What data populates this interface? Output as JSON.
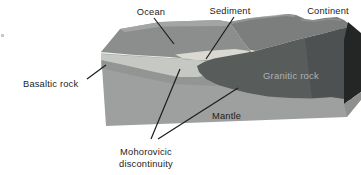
{
  "diagram": {
    "labels": {
      "ocean": "Ocean",
      "sediment": "Sediment",
      "continent": "Continent",
      "basaltic_rock": "Basaltic rock",
      "granitic_rock": "Granitic rock",
      "mantle": "Mantle",
      "moho_line1": "Mohorovicic",
      "moho_line2": "discontinuity"
    },
    "colors": {
      "background": "#ffffff",
      "ocean_surface": "#8b8e8d",
      "ocean_back_strip": "#a5a7a5",
      "continent_surface": "#7b7e7d",
      "continent_highlight": "#9a9d9b",
      "granitic_rock": "#585c5b",
      "granitic_rock_shadow": "#454848",
      "basaltic_layer": "#c6c8c3",
      "sediment_patch": "#d9d9d1",
      "mantle_front": "#9da09e",
      "mantle_shading": "#8d908f",
      "side_face_dark": "#242626",
      "side_face_mantle": "#8f908e",
      "edge_highlight": "#eef0ea",
      "label_text": "#1c1c1c",
      "granitic_label_text": "#b0b2b0",
      "leader_line": "#1c1c1c",
      "stray_mark": "#c9c9c9"
    }
  }
}
